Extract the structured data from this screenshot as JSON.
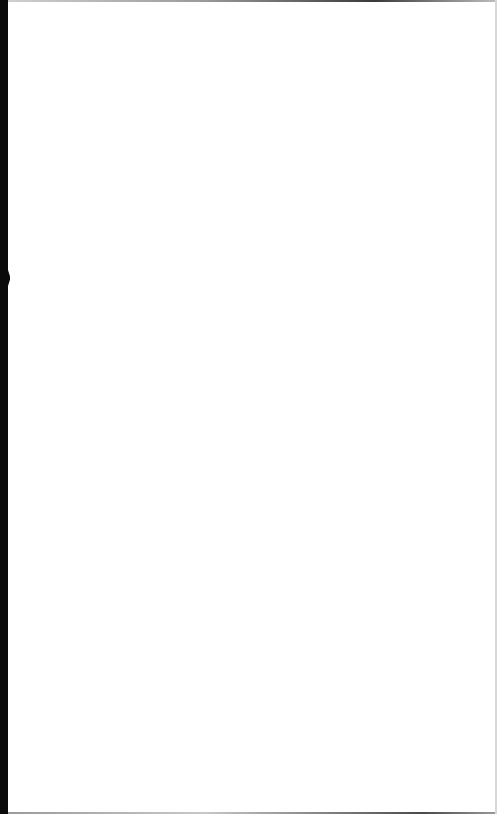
{
  "page": {
    "type": "blank-scanned-page",
    "background_color": "#ffffff",
    "edge_color": "#0a0a0a",
    "text": ""
  }
}
